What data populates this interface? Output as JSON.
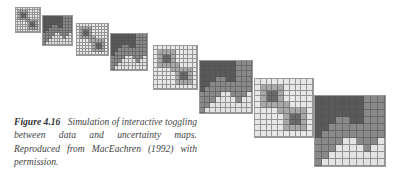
{
  "figure": {
    "label": "Figure 4.16",
    "caption": "Simulation of interactive toggling between data and uncertainty maps. Reproduced from MacEachren (1992) with permission.",
    "colors": {
      "dark": "#5a5a5a",
      "medium": "#8a8a8a",
      "light": "#e4e4e4",
      "uncert_high": "#6a6a6a",
      "uncert_mid": "#a8a8a8",
      "uncert_low": "#e8e8e8"
    },
    "panels": [
      {
        "type": "uncertainty",
        "x": 15,
        "y": 7,
        "size": 26,
        "grid": 10
      },
      {
        "type": "data",
        "x": 42,
        "y": 15,
        "size": 31,
        "grid": 10
      },
      {
        "type": "uncertainty",
        "x": 76,
        "y": 23,
        "size": 33,
        "grid": 10
      },
      {
        "type": "data",
        "x": 110,
        "y": 33,
        "size": 38,
        "grid": 10
      },
      {
        "type": "uncertainty",
        "x": 153,
        "y": 45,
        "size": 45,
        "grid": 10
      },
      {
        "type": "data",
        "x": 199,
        "y": 60,
        "size": 54,
        "grid": 10
      },
      {
        "type": "uncertainty",
        "x": 254,
        "y": 78,
        "size": 60,
        "grid": 10
      },
      {
        "type": "data",
        "x": 314,
        "y": 95,
        "size": 72,
        "grid": 10
      }
    ]
  }
}
